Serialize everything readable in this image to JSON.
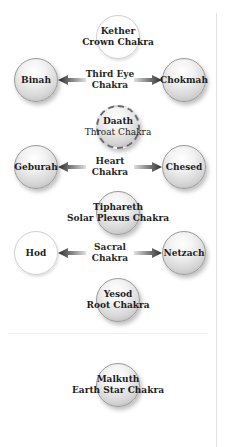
{
  "diagram": {
    "title": "",
    "nodes": [
      {
        "id": "kether",
        "name": "Kether",
        "subtitle": "Crown Chakra",
        "style": "white"
      },
      {
        "id": "binah",
        "name": "Binah",
        "subtitle": "",
        "style": "grey"
      },
      {
        "id": "chokmah",
        "name": "Chokmah",
        "subtitle": "",
        "style": "grey"
      },
      {
        "id": "daath",
        "name": "Daath",
        "subtitle": "Throat Chakra",
        "style": "grey-dashed"
      },
      {
        "id": "geburah",
        "name": "Geburah",
        "subtitle": "",
        "style": "grey"
      },
      {
        "id": "chesed",
        "name": "Chesed",
        "subtitle": "",
        "style": "grey"
      },
      {
        "id": "tiphareth",
        "name": "Tiphareth",
        "subtitle": "Solar Plexus Chakra",
        "style": "grey"
      },
      {
        "id": "hod",
        "name": "Hod",
        "subtitle": "",
        "style": "white"
      },
      {
        "id": "netzach",
        "name": "Netzach",
        "subtitle": "",
        "style": "grey"
      },
      {
        "id": "yesod",
        "name": "Yesod",
        "subtitle": "Root Chakra",
        "style": "grey"
      },
      {
        "id": "malkuth",
        "name": "Malkuth",
        "subtitle": "Earth Star Chakra",
        "style": "grey"
      }
    ],
    "pair_labels": [
      {
        "line1": "Third Eye",
        "line2": "Chakra",
        "left": "Binah",
        "right": "Chokmah"
      },
      {
        "line1": "Heart",
        "line2": "Chakra",
        "left": "Geburah",
        "right": "Chesed"
      },
      {
        "line1": "Sacral",
        "line2": "Chakra",
        "left": "Hod",
        "right": "Netzach"
      }
    ],
    "edges": [
      {
        "from": "Third Eye Chakra",
        "to": "Binah",
        "type": "arrow"
      },
      {
        "from": "Third Eye Chakra",
        "to": "Chokmah",
        "type": "arrow"
      },
      {
        "from": "Heart Chakra",
        "to": "Geburah",
        "type": "arrow"
      },
      {
        "from": "Heart Chakra",
        "to": "Chesed",
        "type": "arrow"
      },
      {
        "from": "Sacral Chakra",
        "to": "Hod",
        "type": "arrow"
      },
      {
        "from": "Sacral Chakra",
        "to": "Netzach",
        "type": "arrow"
      }
    ],
    "colors": {
      "node_grey_light": "#f3f3f3",
      "node_grey_dark": "#b0b0b0",
      "node_white": "#ffffff",
      "arrow": "#333333",
      "text": "#1e1e1e",
      "divider": "#e2e2e2"
    }
  }
}
